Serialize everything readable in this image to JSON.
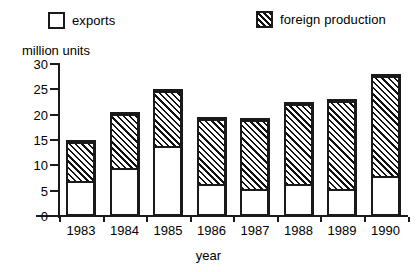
{
  "legend": {
    "items": [
      {
        "label": "exports",
        "swatch": "white-square-icon",
        "pattern": "solid-white"
      },
      {
        "label": "foreign production",
        "swatch": "hatched-square-icon",
        "pattern": "diagonal-hatch"
      }
    ]
  },
  "axes": {
    "y_title": "million units",
    "x_title": "year",
    "y_ticks": [
      0,
      5,
      10,
      15,
      20,
      25,
      30
    ]
  },
  "colors": {
    "ink": "#1a1a1a",
    "background": "#ffffff",
    "exports_fill": "#ffffff",
    "foreign_fill": "#ffffff",
    "hatch_stroke": "#111111"
  },
  "chart_data": {
    "type": "bar",
    "title": "",
    "subtitle": "",
    "xlabel": "year",
    "ylabel": "million units",
    "ylim": [
      0,
      30
    ],
    "ytick_step": 5,
    "grid": false,
    "stacked": true,
    "legend_position": "top",
    "categories": [
      "1983",
      "1984",
      "1985",
      "1986",
      "1987",
      "1988",
      "1989",
      "1990"
    ],
    "series": [
      {
        "name": "exports",
        "values": [
          6.5,
          9,
          13.5,
          6,
          5,
          6,
          5,
          7.5
        ]
      },
      {
        "name": "foreign production",
        "values": [
          8.5,
          11.5,
          11.5,
          13.5,
          14.3,
          16.5,
          18,
          20.5
        ]
      }
    ],
    "totals": [
      15,
      20.5,
      25,
      19.5,
      19.3,
      22.5,
      23,
      28
    ]
  }
}
